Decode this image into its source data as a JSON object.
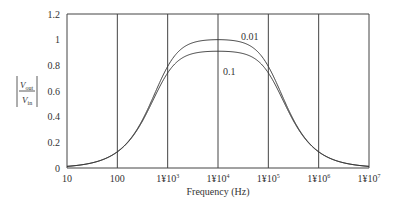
{
  "chart_data": {
    "type": "line",
    "title": "",
    "xlabel": "Frequency (Hz)",
    "ylabel": "|V_out / V_in|",
    "xscale": "log",
    "xlim": [
      10,
      10000000
    ],
    "ylim": [
      0,
      1.2
    ],
    "grid": {
      "vertical": true,
      "horizontal": false
    },
    "x_tick_labels": [
      "10",
      "100",
      "1¥10^3",
      "1¥10^4",
      "1¥10^5",
      "1¥10^6",
      "1¥10^7"
    ],
    "y_tick_labels": [
      "0",
      "0.2",
      "0.4",
      "0.6",
      "0.8",
      "1",
      "1.2"
    ],
    "x": [
      10,
      31.6,
      100,
      316,
      1000,
      3162,
      10000,
      31623,
      100000,
      316228,
      1000000,
      3162278,
      10000000
    ],
    "series": [
      {
        "name": "0.01",
        "values": [
          0.02,
          0.05,
          0.12,
          0.32,
          0.66,
          0.92,
          1.0,
          0.92,
          0.66,
          0.32,
          0.12,
          0.05,
          0.02
        ]
      },
      {
        "name": "0.1",
        "values": [
          0.02,
          0.05,
          0.12,
          0.33,
          0.66,
          0.86,
          0.91,
          0.86,
          0.66,
          0.33,
          0.12,
          0.05,
          0.02
        ]
      }
    ],
    "annotations": [
      {
        "text": "0.01",
        "x": 100000,
        "y": 1.05
      },
      {
        "text": "0.1",
        "x": 35000,
        "y": 0.78
      }
    ]
  },
  "labels": {
    "xlabel": "Frequency (Hz)",
    "y_num": "V",
    "y_num_sub": "out",
    "y_den": "V",
    "y_den_sub": "in",
    "ann1": "0.01",
    "ann2": "0.1",
    "x_ticks": [
      {
        "base": "10",
        "exp": ""
      },
      {
        "base": "100",
        "exp": ""
      },
      {
        "base": "1¥10",
        "exp": "3"
      },
      {
        "base": "1¥10",
        "exp": "4"
      },
      {
        "base": "1¥10",
        "exp": "5"
      },
      {
        "base": "1¥10",
        "exp": "6"
      },
      {
        "base": "1¥10",
        "exp": "7"
      }
    ],
    "y_ticks": [
      "0",
      "0.2",
      "0.4",
      "0.6",
      "0.8",
      "1",
      "1.2"
    ]
  }
}
